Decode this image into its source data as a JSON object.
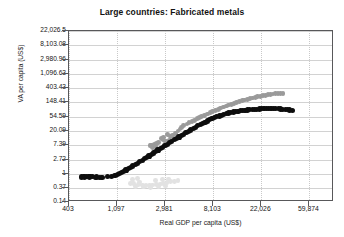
{
  "chart_data": {
    "type": "scatter",
    "title": "Large countries: Fabricated metals",
    "xlabel": "Real GDP per capita (US$)",
    "ylabel": "VA per capita (US$)",
    "xscale": "log",
    "yscale": "log",
    "grid": true,
    "legend": "none",
    "xlim": [
      403,
      100000
    ],
    "ylim": [
      0.14,
      22026.5
    ],
    "xticks": [
      "403",
      "1,097",
      "2,981",
      "8,103",
      "22,026",
      "59,874"
    ],
    "xtick_values": [
      403,
      1097,
      2981,
      8103,
      22026,
      59874
    ],
    "yticks": [
      "22,026.5",
      "8,103.08",
      "2,980.96",
      "1,096.63",
      "403.43",
      "148.41",
      "54.59",
      "20.09",
      "7.39",
      "2.72",
      "1",
      "0.37",
      "0.14"
    ],
    "ytick_values": [
      22026.5,
      8103.08,
      2980.96,
      1096.63,
      403.43,
      148.41,
      54.59,
      20.09,
      7.39,
      2.72,
      1,
      0.37,
      0.14
    ],
    "annotations": [
      {
        "text": "Republic of Korea",
        "x": 4400,
        "y": 330
      },
      {
        "text": "Malaysia",
        "x": 12500,
        "y": 26
      },
      {
        "text": "Sri Lanka",
        "x": 3400,
        "y": 1.25
      }
    ],
    "series": [
      {
        "name": "Malaysia",
        "color": "#0d0d0d",
        "marker_size": 2.6,
        "points": [
          [
            520,
            0.8
          ],
          [
            545,
            0.81
          ],
          [
            560,
            0.8
          ],
          [
            580,
            0.82
          ],
          [
            600,
            0.81
          ],
          [
            615,
            0.8
          ],
          [
            635,
            0.82
          ],
          [
            655,
            0.81
          ],
          [
            700,
            0.79
          ],
          [
            720,
            0.8
          ],
          [
            760,
            0.79
          ],
          [
            800,
            0.79
          ],
          [
            900,
            0.81
          ],
          [
            980,
            0.84
          ],
          [
            1050,
            0.88
          ],
          [
            1100,
            0.95
          ],
          [
            1150,
            1.02
          ],
          [
            1200,
            1.1
          ],
          [
            1260,
            1.2
          ],
          [
            1320,
            1.32
          ],
          [
            1390,
            1.45
          ],
          [
            1450,
            1.58
          ],
          [
            1520,
            1.74
          ],
          [
            1600,
            1.92
          ],
          [
            1680,
            2.12
          ],
          [
            1760,
            2.34
          ],
          [
            1850,
            2.6
          ],
          [
            1940,
            2.88
          ],
          [
            2030,
            3.18
          ],
          [
            2130,
            3.52
          ],
          [
            2230,
            3.9
          ],
          [
            2340,
            4.32
          ],
          [
            2450,
            4.78
          ],
          [
            2570,
            5.3
          ],
          [
            2700,
            5.88
          ],
          [
            2830,
            6.5
          ],
          [
            2970,
            7.2
          ],
          [
            3110,
            7.95
          ],
          [
            3270,
            8.8
          ],
          [
            3430,
            9.72
          ],
          [
            3600,
            10.8
          ],
          [
            3780,
            11.9
          ],
          [
            3970,
            13.2
          ],
          [
            4170,
            14.6
          ],
          [
            4380,
            16.1
          ],
          [
            4600,
            17.8
          ],
          [
            4830,
            19.6
          ],
          [
            5070,
            21.6
          ],
          [
            5330,
            23.8
          ],
          [
            5600,
            26.2
          ],
          [
            5880,
            28.8
          ],
          [
            6170,
            31.5
          ],
          [
            6490,
            34.4
          ],
          [
            6820,
            37.5
          ],
          [
            7160,
            40.7
          ],
          [
            7520,
            44.0
          ],
          [
            7900,
            47.4
          ],
          [
            8300,
            50.9
          ],
          [
            8720,
            54.3
          ],
          [
            9160,
            57.8
          ],
          [
            9620,
            61.2
          ],
          [
            10100,
            64.5
          ],
          [
            10600,
            67.6
          ],
          [
            11150,
            70.6
          ],
          [
            11700,
            73.4
          ],
          [
            12300,
            76.0
          ],
          [
            12900,
            78.4
          ],
          [
            13550,
            80.6
          ],
          [
            14200,
            82.6
          ],
          [
            14900,
            84.4
          ],
          [
            15700,
            86.1
          ],
          [
            16500,
            87.6
          ],
          [
            17300,
            89.0
          ],
          [
            18200,
            90.3
          ],
          [
            19100,
            91.5
          ],
          [
            20100,
            92.6
          ],
          [
            21100,
            93.6
          ],
          [
            22200,
            94.5
          ],
          [
            23300,
            95.3
          ],
          [
            24500,
            95.9
          ],
          [
            25700,
            96.3
          ],
          [
            27000,
            96.5
          ],
          [
            28400,
            96.4
          ],
          [
            29800,
            96.0
          ],
          [
            31300,
            95.3
          ],
          [
            32900,
            94.3
          ],
          [
            34500,
            93.0
          ],
          [
            36200,
            91.4
          ],
          [
            38000,
            89.6
          ],
          [
            39900,
            87.5
          ],
          [
            41900,
            85.5
          ]
        ]
      },
      {
        "name": "Republic of Korea",
        "color": "#9a9a9a",
        "marker_size": 2.4,
        "points": [
          [
            2170,
            7.2
          ],
          [
            2260,
            7.6
          ],
          [
            2380,
            8.0
          ],
          [
            2490,
            8.4
          ],
          [
            2600,
            8.9
          ],
          [
            2300,
            6.2
          ],
          [
            2440,
            6.8
          ],
          [
            2980,
            9.4
          ],
          [
            3100,
            10.0
          ],
          [
            3250,
            10.5
          ],
          [
            3400,
            11.2
          ],
          [
            3350,
            13.5
          ],
          [
            3500,
            14.8
          ],
          [
            2750,
            12.0
          ],
          [
            2900,
            12.8
          ],
          [
            4200,
            26.0
          ],
          [
            4400,
            30.0
          ],
          [
            4700,
            33.0
          ],
          [
            4900,
            36.0
          ],
          [
            5200,
            39.0
          ],
          [
            5500,
            43.0
          ],
          [
            5800,
            47.0
          ],
          [
            6100,
            51.0
          ],
          [
            6400,
            55.0
          ],
          [
            6800,
            60.0
          ],
          [
            7200,
            66.0
          ],
          [
            7600,
            72.0
          ],
          [
            8000,
            78.0
          ],
          [
            8500,
            85.0
          ],
          [
            9000,
            92.0
          ],
          [
            9500,
            100.0
          ],
          [
            10000,
            108.0
          ],
          [
            10600,
            116.0
          ],
          [
            11200,
            124.0
          ],
          [
            11800,
            132.0
          ],
          [
            12500,
            141.0
          ],
          [
            13200,
            150.0
          ],
          [
            14000,
            159.0
          ],
          [
            14800,
            168.0
          ],
          [
            15600,
            177.0
          ],
          [
            16500,
            186.0
          ],
          [
            17400,
            195.0
          ],
          [
            18400,
            204.0
          ],
          [
            19400,
            213.0
          ],
          [
            20500,
            222.0
          ],
          [
            21600,
            231.0
          ],
          [
            22800,
            240.0
          ],
          [
            24000,
            248.0
          ],
          [
            25300,
            256.0
          ],
          [
            26700,
            263.0
          ],
          [
            28100,
            269.0
          ],
          [
            29600,
            274.0
          ],
          [
            31200,
            278.0
          ],
          [
            32900,
            281.0
          ],
          [
            34600,
            283.0
          ],
          [
            3700,
            17.0
          ],
          [
            3900,
            20.0
          ],
          [
            4050,
            23.0
          ],
          [
            3150,
            15.5
          ],
          [
            2850,
            10.8
          ]
        ]
      },
      {
        "name": "Sri Lanka",
        "color": "#e2e2e2",
        "marker_size": 2.4,
        "points": [
          [
            1450,
            0.52
          ],
          [
            1550,
            0.5
          ],
          [
            1700,
            0.48
          ],
          [
            1850,
            0.46
          ],
          [
            2000,
            0.45
          ],
          [
            2150,
            0.44
          ],
          [
            2300,
            0.46
          ],
          [
            2500,
            0.47
          ],
          [
            2700,
            0.49
          ],
          [
            2900,
            0.52
          ],
          [
            3100,
            0.55
          ],
          [
            3350,
            0.58
          ],
          [
            1600,
            0.42
          ],
          [
            1900,
            0.4
          ],
          [
            2200,
            0.39
          ],
          [
            3600,
            0.6
          ],
          [
            3900,
            0.63
          ],
          [
            2600,
            0.41
          ],
          [
            3000,
            0.43
          ],
          [
            1750,
            0.57
          ],
          [
            2450,
            0.62
          ],
          [
            2800,
            0.66
          ],
          [
            3200,
            0.7
          ],
          [
            1500,
            0.68
          ],
          [
            1680,
            0.72
          ]
        ]
      }
    ]
  }
}
